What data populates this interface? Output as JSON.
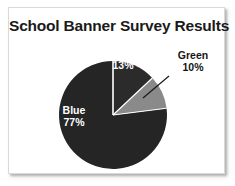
{
  "chart_data": {
    "type": "pie",
    "title": "School Banner Survey Results",
    "categories": [
      "Red",
      "Green",
      "Blue"
    ],
    "values": [
      13,
      10,
      77
    ],
    "value_suffix": "%",
    "start_angle_deg": 0,
    "direction": "clockwise",
    "legend": "none",
    "grid": false,
    "xlabel": "",
    "ylabel": "",
    "slices": [
      {
        "name": "Red",
        "value": 13,
        "label": "Red",
        "value_label": "13%",
        "fill": "#2b2b2b",
        "label_position": "inside",
        "label_color": "#ffffff"
      },
      {
        "name": "Green",
        "value": 10,
        "label": "Green",
        "value_label": "10%",
        "fill": "#8a8a8a",
        "label_position": "outside",
        "label_color": "#151515",
        "has_leader_line": true
      },
      {
        "name": "Blue",
        "value": 77,
        "label": "Blue",
        "value_label": "77%",
        "fill": "#252525",
        "label_position": "inside",
        "label_color": "#ffffff"
      }
    ]
  },
  "card": {
    "background": "#ffffff",
    "border_color": "#d9d9d9"
  },
  "icons": {
    "leader_line": "leader-line"
  }
}
